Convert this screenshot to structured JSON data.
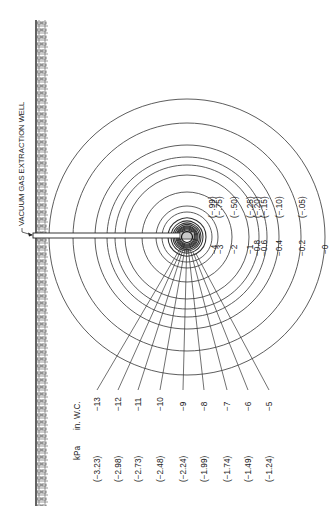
{
  "figure": {
    "well_label": "VACUUM GAS EXTRACTION WELL",
    "units": {
      "kpa": "kPa",
      "inwc": "in. W.C."
    },
    "center": {
      "x": 187,
      "y": 237
    },
    "colors": {
      "line": "#333333",
      "soil": "#555555",
      "background": "#ffffff"
    },
    "contours": [
      {
        "inwc": "0",
        "kpa": "",
        "r": 138
      },
      {
        "inwc": "0.2",
        "kpa": "(−.05)",
        "r": 114
      },
      {
        "inwc": "0.4",
        "kpa": "(−.10)",
        "r": 92
      },
      {
        "inwc": "0.6",
        "kpa": "(−.15)",
        "r": 80
      },
      {
        "inwc": "0.8",
        "kpa": "(−.20)",
        "r": 72
      },
      {
        "inwc": "−1",
        "kpa": "(−.25)",
        "r": 62
      },
      {
        "inwc": "−2",
        "kpa": "(−.50)",
        "r": 45
      },
      {
        "inwc": "−3",
        "kpa": "(−.75)",
        "r": 31
      },
      {
        "inwc": "−4",
        "kpa": "(−.99)",
        "r": 25
      },
      {
        "inwc": "−5",
        "kpa": "(−1.24)",
        "r": 19
      },
      {
        "inwc": "−6",
        "kpa": "(−1.49)",
        "r": 16
      },
      {
        "inwc": "−7",
        "kpa": "(−1.74)",
        "r": 14
      },
      {
        "inwc": "−8",
        "kpa": "(−1.99)",
        "r": 12.5
      },
      {
        "inwc": "−9",
        "kpa": "(−2.24)",
        "r": 11
      },
      {
        "inwc": "−10",
        "kpa": "(−2.48)",
        "r": 10
      },
      {
        "inwc": "−11",
        "kpa": "(−2.73)",
        "r": 9
      },
      {
        "inwc": "−12",
        "kpa": "(−2.98)",
        "r": 8
      },
      {
        "inwc": "−13",
        "kpa": "(−3.23)",
        "r": 7
      }
    ],
    "right_labels": [
      {
        "text": "−4",
        "x": 214,
        "y": 246,
        "kpa": "(−.99)",
        "kx": 212,
        "ky": 218
      },
      {
        "text": "−3",
        "x": 220,
        "y": 246,
        "kpa": "(−.75)",
        "kx": 219,
        "ky": 218
      },
      {
        "text": "−2",
        "x": 234,
        "y": 246,
        "kpa": "(−.50)",
        "kx": 234,
        "ky": 218
      },
      {
        "text": "−1",
        "x": 250,
        "y": 246,
        "kpa": "(−.25)",
        "kx": 250,
        "ky": 218
      },
      {
        "text": "−0.8",
        "x": 257,
        "y": 248,
        "kpa": "(−.20)",
        "kx": 257,
        "ky": 218
      },
      {
        "text": "−0.6",
        "x": 264,
        "y": 248,
        "kpa": "(−.15)",
        "kx": 264,
        "ky": 218
      },
      {
        "text": "−0.4",
        "x": 279,
        "y": 248,
        "kpa": "(−.10)",
        "kx": 279,
        "ky": 218
      },
      {
        "text": "−0.2",
        "x": 302,
        "y": 248,
        "kpa": "(−.05)",
        "kx": 302,
        "ky": 218
      },
      {
        "text": "−0",
        "x": 325,
        "y": 246,
        "kpa": "",
        "kx": 325,
        "ky": 218
      }
    ],
    "left_labels": [
      {
        "inwc": "−13",
        "kpa": "(−3.23)",
        "x": 80
      },
      {
        "inwc": "−12",
        "kpa": "(−2.98)",
        "x": 101
      },
      {
        "inwc": "−11",
        "kpa": "(−2.73)",
        "x": 121
      },
      {
        "inwc": "−10",
        "kpa": "(−2.48)",
        "x": 143
      },
      {
        "inwc": "−9",
        "kpa": "(−2.24)",
        "x": 166
      },
      {
        "inwc": "−8",
        "kpa": "(−1.99)",
        "x": 187
      },
      {
        "inwc": "−7",
        "kpa": "(−1.74)",
        "x": 210
      },
      {
        "inwc": "−6",
        "kpa": "(−1.49)",
        "x": 231
      },
      {
        "inwc": "−5",
        "kpa": "(−1.24)",
        "x": 252
      }
    ]
  }
}
